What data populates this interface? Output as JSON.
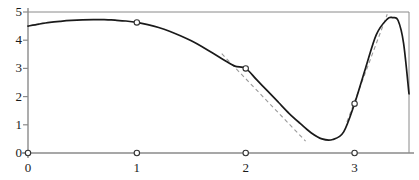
{
  "chart_data": {
    "type": "line",
    "title": "",
    "subtitle": "",
    "xlabel": "",
    "ylabel": "",
    "xlim": [
      0,
      3.5
    ],
    "ylim": [
      0,
      5
    ],
    "grid": false,
    "legend": null,
    "x_ticks": [
      0,
      1,
      2,
      3
    ],
    "x_tick_labels": [
      "0",
      "1",
      "2",
      "3"
    ],
    "y_ticks": [
      0,
      1,
      2,
      3,
      4,
      5
    ],
    "y_tick_labels": [
      "0",
      "1",
      "2",
      "3",
      "4",
      "5"
    ],
    "series": [
      {
        "name": "function-curve",
        "style": "solid",
        "color": "#1a1a1a",
        "x": [
          0.0,
          0.1,
          0.2,
          0.3,
          0.4,
          0.5,
          0.6,
          0.7,
          0.75,
          0.8,
          0.9,
          1.0,
          1.1,
          1.2,
          1.3,
          1.4,
          1.5,
          1.6,
          1.7,
          1.8,
          1.9,
          2.0,
          2.1,
          2.2,
          2.3,
          2.4,
          2.5,
          2.6,
          2.7,
          2.8,
          2.9,
          3.0,
          3.1,
          3.2,
          3.3,
          3.35,
          3.4,
          3.45,
          3.5
        ],
        "y": [
          4.5,
          4.57,
          4.63,
          4.67,
          4.7,
          4.72,
          4.73,
          4.73,
          4.72,
          4.71,
          4.68,
          4.63,
          4.55,
          4.45,
          4.32,
          4.16,
          3.98,
          3.77,
          3.54,
          3.3,
          3.08,
          3.0,
          2.6,
          2.2,
          1.8,
          1.4,
          1.05,
          0.72,
          0.5,
          0.48,
          0.75,
          1.75,
          3.0,
          4.2,
          4.75,
          4.8,
          4.7,
          3.9,
          2.1
        ]
      },
      {
        "name": "tangent-at-x2",
        "style": "dashed",
        "color": "#9a9a9a",
        "x": [
          1.78,
          2.55
        ],
        "y": [
          3.52,
          0.42
        ]
      },
      {
        "name": "tangent-at-x3",
        "style": "dashed",
        "color": "#9a9a9a",
        "x": [
          2.93,
          3.3
        ],
        "y": [
          1.1,
          4.92
        ]
      }
    ],
    "curve_markers": {
      "name": "curve-point-markers",
      "shape": "open-circle",
      "x": [
        1,
        2,
        3
      ],
      "y": [
        4.63,
        3.0,
        1.75
      ]
    },
    "axis_markers": {
      "name": "axis-node-markers",
      "shape": "open-circle",
      "x": [
        0,
        1,
        2,
        3
      ],
      "y": [
        0,
        0,
        0,
        0
      ]
    },
    "frame": {
      "top_line": true,
      "right_line": true,
      "bottom_axis": true,
      "left_axis": true,
      "axis_color": "#8a8a8a",
      "frame_color": "#8a8a8a"
    },
    "annotations": []
  }
}
